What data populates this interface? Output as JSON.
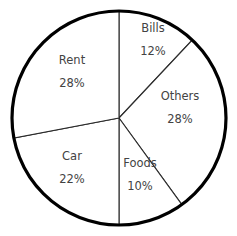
{
  "chart_data": {
    "type": "pie",
    "title": "",
    "subtitle": "",
    "xlabel": "",
    "ylabel": "",
    "legend": "none",
    "grid": false,
    "units": "percent",
    "total": 100,
    "start_angle_deg": 0,
    "direction": "clockwise",
    "categories": [
      "Bills",
      "Others",
      "Foods",
      "Car",
      "Rent"
    ],
    "values": [
      12,
      28,
      10,
      22,
      28
    ],
    "slices": [
      {
        "label": "Bills",
        "value": 12,
        "value_text": "12%",
        "sweep_deg": 43.2,
        "start_deg": 0,
        "end_deg": 43.2,
        "label_x": 153,
        "label_y": 40
      },
      {
        "label": "Others",
        "value": 28,
        "value_text": "28%",
        "sweep_deg": 100.8,
        "start_deg": 43.2,
        "end_deg": 144,
        "label_x": 180,
        "label_y": 108
      },
      {
        "label": "Foods",
        "value": 10,
        "value_text": "10%",
        "sweep_deg": 36,
        "start_deg": 144,
        "end_deg": 180,
        "label_x": 140,
        "label_y": 175
      },
      {
        "label": "Car",
        "value": 22,
        "value_text": "22%",
        "sweep_deg": 79.2,
        "start_deg": 180,
        "end_deg": 259.2,
        "label_x": 72,
        "label_y": 168
      },
      {
        "label": "Rent",
        "value": 28,
        "value_text": "28%",
        "sweep_deg": 100.8,
        "start_deg": 259.2,
        "end_deg": 360,
        "label_x": 72,
        "label_y": 72
      }
    ],
    "geometry": {
      "center_x": 119,
      "center_y": 118,
      "radius": 107
    },
    "colors": {
      "background": "#ffffff",
      "slice_fill": "#ffffff",
      "slice_stroke": "#2b2b2b",
      "outline_stroke": "#000000",
      "label_text": "#434343"
    }
  }
}
